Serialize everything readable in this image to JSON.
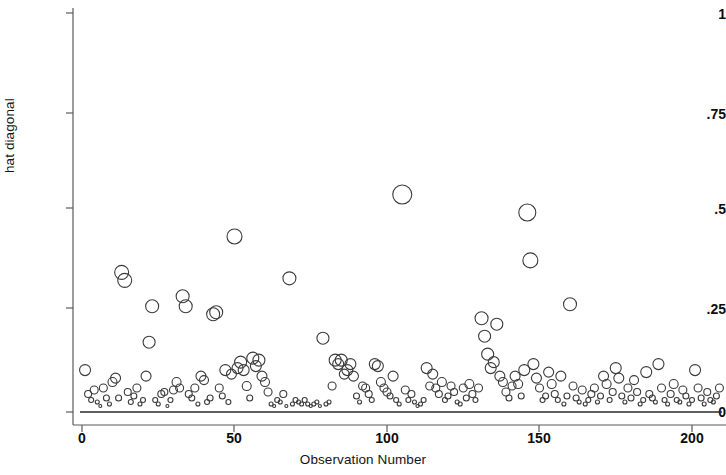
{
  "chart_data": {
    "type": "scatter",
    "title": "",
    "subtitle": "",
    "xlabel": "Observation Number",
    "ylabel": "hat diagonal",
    "xlim": [
      -3,
      212
    ],
    "ylim": [
      0,
      1.02
    ],
    "xticks": [
      0,
      50,
      100,
      150,
      200
    ],
    "xtick_labels": [
      "0",
      "50",
      "100",
      "150",
      "200"
    ],
    "yticks": [
      0,
      0.25,
      0.5,
      0.75,
      1
    ],
    "ytick_labels": [
      "0",
      ".25",
      ".5",
      ".75",
      "1"
    ],
    "grid": false,
    "legend": null,
    "marker": {
      "shape": "circle",
      "fill": "none",
      "stroke": "#3b3b3b",
      "stroke_width": 1.1,
      "size_encodes": "weight"
    },
    "reference_line": {
      "y": 0,
      "color": "#2a2a2a",
      "width": 1.4
    },
    "series": [
      {
        "name": "hat diagonal",
        "x": [
          1,
          2,
          3,
          4,
          5,
          6,
          7,
          8,
          9,
          10,
          11,
          12,
          13,
          14,
          15,
          16,
          17,
          18,
          19,
          20,
          21,
          22,
          23,
          24,
          25,
          26,
          27,
          28,
          29,
          30,
          31,
          32,
          33,
          34,
          35,
          36,
          37,
          38,
          39,
          40,
          41,
          42,
          43,
          44,
          45,
          46,
          47,
          48,
          49,
          50,
          51,
          52,
          53,
          54,
          55,
          56,
          57,
          58,
          59,
          60,
          61,
          62,
          63,
          64,
          65,
          66,
          67,
          68,
          69,
          70,
          71,
          72,
          73,
          74,
          75,
          76,
          77,
          78,
          79,
          80,
          81,
          82,
          83,
          84,
          85,
          86,
          87,
          88,
          89,
          90,
          91,
          92,
          93,
          94,
          95,
          96,
          97,
          98,
          99,
          100,
          101,
          102,
          103,
          104,
          105,
          106,
          107,
          108,
          109,
          110,
          111,
          112,
          113,
          114,
          115,
          116,
          117,
          118,
          119,
          120,
          121,
          122,
          123,
          124,
          125,
          126,
          127,
          128,
          129,
          130,
          131,
          132,
          133,
          134,
          135,
          136,
          137,
          138,
          139,
          140,
          141,
          142,
          143,
          144,
          145,
          146,
          147,
          148,
          149,
          150,
          151,
          152,
          153,
          154,
          155,
          156,
          157,
          158,
          159,
          160,
          161,
          162,
          163,
          164,
          165,
          166,
          167,
          168,
          169,
          170,
          171,
          172,
          173,
          174,
          175,
          176,
          177,
          178,
          179,
          180,
          181,
          182,
          183,
          184,
          185,
          186,
          187,
          188,
          189,
          190,
          191,
          192,
          193,
          194,
          195,
          196,
          197,
          198,
          199,
          200,
          201,
          202,
          203,
          204,
          205,
          206,
          207,
          208,
          209
        ],
        "y": [
          0.105,
          0.045,
          0.03,
          0.055,
          0.025,
          0.015,
          0.06,
          0.035,
          0.02,
          0.075,
          0.085,
          0.035,
          0.35,
          0.33,
          0.05,
          0.025,
          0.04,
          0.06,
          0.02,
          0.03,
          0.09,
          0.175,
          0.265,
          0.03,
          0.02,
          0.045,
          0.05,
          0.015,
          0.03,
          0.055,
          0.075,
          0.06,
          0.29,
          0.265,
          0.045,
          0.035,
          0.06,
          0.02,
          0.09,
          0.08,
          0.025,
          0.035,
          0.245,
          0.25,
          0.06,
          0.04,
          0.105,
          0.025,
          0.095,
          0.44,
          0.11,
          0.125,
          0.105,
          0.065,
          0.035,
          0.135,
          0.115,
          0.13,
          0.09,
          0.075,
          0.05,
          0.02,
          0.015,
          0.03,
          0.025,
          0.045,
          0.015,
          0.335,
          0.02,
          0.03,
          0.025,
          0.02,
          0.03,
          0.02,
          0.015,
          0.02,
          0.025,
          0.015,
          0.185,
          0.02,
          0.025,
          0.065,
          0.13,
          0.12,
          0.13,
          0.095,
          0.105,
          0.12,
          0.09,
          0.04,
          0.025,
          0.065,
          0.06,
          0.045,
          0.03,
          0.12,
          0.115,
          0.075,
          0.06,
          0.05,
          0.04,
          0.09,
          0.03,
          0.02,
          0.545,
          0.055,
          0.03,
          0.045,
          0.025,
          0.015,
          0.02,
          0.03,
          0.11,
          0.065,
          0.095,
          0.06,
          0.045,
          0.075,
          0.03,
          0.04,
          0.065,
          0.05,
          0.025,
          0.02,
          0.06,
          0.035,
          0.07,
          0.045,
          0.03,
          0.06,
          0.235,
          0.19,
          0.145,
          0.11,
          0.125,
          0.22,
          0.09,
          0.075,
          0.05,
          0.035,
          0.065,
          0.09,
          0.07,
          0.04,
          0.105,
          0.5,
          0.38,
          0.12,
          0.085,
          0.06,
          0.03,
          0.04,
          0.1,
          0.07,
          0.045,
          0.03,
          0.09,
          0.02,
          0.04,
          0.27,
          0.065,
          0.035,
          0.025,
          0.055,
          0.02,
          0.03,
          0.045,
          0.06,
          0.025,
          0.04,
          0.09,
          0.07,
          0.03,
          0.05,
          0.11,
          0.085,
          0.04,
          0.025,
          0.06,
          0.035,
          0.08,
          0.05,
          0.02,
          0.03,
          0.1,
          0.045,
          0.035,
          0.025,
          0.12,
          0.06,
          0.03,
          0.02,
          0.045,
          0.07,
          0.03,
          0.025,
          0.055,
          0.04,
          0.02,
          0.03,
          0.105,
          0.06,
          0.035,
          0.02,
          0.05,
          0.03,
          0.025,
          0.04,
          0.06
        ],
        "sizes": [
          11,
          7,
          5,
          8,
          4,
          3,
          8,
          6,
          4,
          9,
          10,
          6,
          14,
          14,
          7,
          5,
          6,
          8,
          4,
          5,
          10,
          12,
          13,
          5,
          4,
          7,
          7,
          3,
          5,
          8,
          9,
          8,
          13,
          13,
          7,
          6,
          8,
          4,
          10,
          9,
          5,
          6,
          13,
          13,
          8,
          6,
          11,
          5,
          10,
          15,
          11,
          12,
          11,
          9,
          6,
          12,
          11,
          12,
          10,
          9,
          8,
          4,
          3,
          5,
          4,
          7,
          3,
          13,
          4,
          5,
          4,
          4,
          5,
          4,
          3,
          4,
          4,
          3,
          12,
          4,
          4,
          8,
          12,
          11,
          12,
          10,
          11,
          11,
          10,
          6,
          4,
          8,
          8,
          7,
          5,
          11,
          11,
          9,
          8,
          8,
          6,
          10,
          5,
          4,
          19,
          8,
          5,
          7,
          4,
          3,
          4,
          5,
          11,
          8,
          10,
          8,
          7,
          9,
          5,
          6,
          8,
          7,
          4,
          4,
          8,
          6,
          9,
          7,
          5,
          8,
          13,
          12,
          12,
          11,
          11,
          12,
          10,
          9,
          8,
          6,
          8,
          10,
          9,
          6,
          11,
          17,
          15,
          11,
          10,
          8,
          5,
          6,
          10,
          9,
          7,
          5,
          10,
          4,
          6,
          13,
          8,
          6,
          4,
          8,
          4,
          5,
          7,
          8,
          4,
          6,
          10,
          9,
          5,
          7,
          11,
          10,
          6,
          4,
          8,
          6,
          9,
          7,
          4,
          5,
          11,
          7,
          6,
          4,
          11,
          8,
          5,
          4,
          7,
          9,
          5,
          4,
          8,
          6,
          4,
          5,
          11,
          8,
          6,
          4,
          7,
          5,
          4,
          6,
          8
        ]
      }
    ]
  },
  "axes": {
    "ylabel": "hat diagonal",
    "xlabel": "Observation Number",
    "ytick_labels": [
      "1",
      ".75",
      ".5",
      ".25",
      "0"
    ],
    "xtick_labels": [
      "0",
      "50",
      "100",
      "150",
      "200"
    ]
  }
}
